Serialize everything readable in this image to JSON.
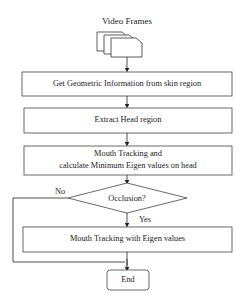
{
  "diagram": {
    "type": "flowchart",
    "input_label": "Video Frames",
    "steps": [
      {
        "id": "geo",
        "label": "Get Geometric Information from skin region"
      },
      {
        "id": "head",
        "label": "Extract Head region"
      },
      {
        "id": "mouth",
        "label_line1": "Mouth Tracking and",
        "label_line2": "calculate Minimum Eigen values on head"
      },
      {
        "id": "occ",
        "label": "Occlusion?",
        "shape": "decision"
      },
      {
        "id": "eigen",
        "label": "Mouth Tracking with Eigen values"
      },
      {
        "id": "end",
        "label": "End",
        "shape": "terminal"
      }
    ],
    "branches": {
      "yes": "Yes",
      "no": "No"
    },
    "edges": [
      {
        "from": "input",
        "to": "geo"
      },
      {
        "from": "geo",
        "to": "head"
      },
      {
        "from": "head",
        "to": "mouth"
      },
      {
        "from": "mouth",
        "to": "occ"
      },
      {
        "from": "occ",
        "to": "eigen",
        "label": "Yes"
      },
      {
        "from": "occ",
        "to": "end",
        "label": "No"
      },
      {
        "from": "eigen",
        "to": "end"
      }
    ]
  }
}
